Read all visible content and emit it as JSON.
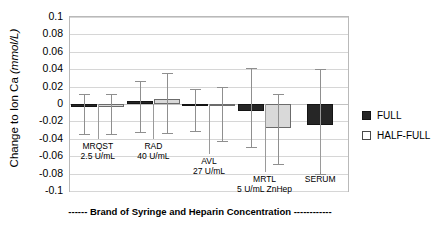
{
  "chart_data": {
    "type": "bar",
    "title": "",
    "xlabel": "------ Brand of Syringe and Heparin Concentration ------------",
    "ylabel_main": "Change to Ion Ca",
    "ylabel_units": "(mmol/L)",
    "ylim": [
      -0.1,
      0.1
    ],
    "ytick_labels": [
      "0.1",
      "0.08",
      "0.06",
      "0.04",
      "0.02",
      "0",
      "-0.02",
      "-0.04",
      "-0.06",
      "-0.08",
      "-0.1"
    ],
    "ytick_values": [
      0.1,
      0.08,
      0.06,
      0.04,
      0.02,
      0,
      -0.02,
      -0.04,
      -0.06,
      -0.08,
      -0.1
    ],
    "grid": true,
    "legend_position": "right",
    "categories": [
      "MRQST",
      "RAD",
      "AVL",
      "MRTL",
      "SERUM"
    ],
    "category_sublabels": [
      "2.5 U/mL",
      "40 U/mL",
      "27 U/mL",
      "5 U/mL ZnHep",
      ""
    ],
    "series": [
      {
        "name": "FULL",
        "color": "#262626",
        "values": [
          -0.004,
          0.003,
          -0.002,
          -0.008,
          -0.024
        ],
        "error_upper": [
          0.011,
          0.026,
          0.017,
          0.041,
          0.04
        ],
        "error_lower": [
          -0.034,
          -0.032,
          -0.031,
          -0.049,
          -0.081
        ]
      },
      {
        "name": "HALF-FULL",
        "color": "#d9d9d9",
        "values": [
          -0.003,
          0.006,
          -0.001,
          -0.028,
          null
        ],
        "error_upper": [
          0.011,
          0.036,
          0.02,
          0.012,
          null
        ],
        "error_lower": [
          -0.035,
          -0.033,
          -0.043,
          -0.069,
          null
        ]
      }
    ]
  },
  "legend": {
    "items": [
      {
        "label": "FULL",
        "swatch": "full"
      },
      {
        "label": "HALF-FULL",
        "swatch": "half"
      }
    ]
  }
}
